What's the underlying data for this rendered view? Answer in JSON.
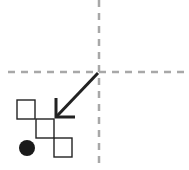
{
  "diagram": {
    "colors": {
      "axis": "#a8a8a8",
      "arrow": "#222222",
      "square_stroke": "#222222",
      "dot": "#1a1a1a",
      "background": "#ffffff"
    },
    "axes": {
      "vertical_x": 99,
      "horizontal_y": 72
    },
    "arrow": {
      "from": [
        98,
        73
      ],
      "to": [
        56,
        117
      ]
    },
    "squares": [
      {
        "x": 17,
        "y": 100,
        "size": 19
      },
      {
        "x": 36,
        "y": 119,
        "size": 19
      },
      {
        "x": 54,
        "y": 138,
        "size": 19
      }
    ],
    "dot": {
      "cx": 27,
      "cy": 148,
      "r": 8
    }
  }
}
